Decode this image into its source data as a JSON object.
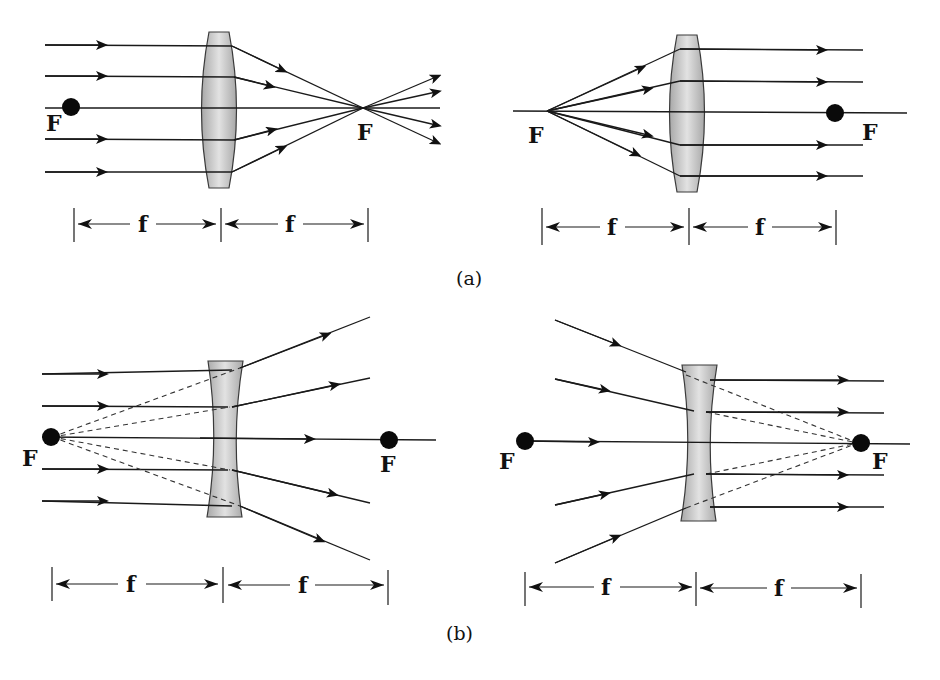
{
  "figure": {
    "captions": {
      "a": "(a)",
      "b": "(b)"
    },
    "focal_label": "F",
    "focal_length_label": "f",
    "colors": {
      "lens_fill_center": "#e2e2e2",
      "lens_fill_edge": "#a8a8a8",
      "ray": "#1a1a1a",
      "dot": "#0a0a0a",
      "background": "#ffffff"
    }
  },
  "panels": [
    {
      "id": "a-left",
      "lens_type": "convex",
      "description": "Parallel rays converge at focal point F after a convex lens",
      "labels": {
        "f_left": "F",
        "f_right": "F",
        "dim_left": "f",
        "dim_right": "f"
      }
    },
    {
      "id": "a-right",
      "lens_type": "convex",
      "description": "Rays from focal point F emerge parallel after a convex lens",
      "labels": {
        "f_left": "F",
        "f_right": "F",
        "dim_left": "f",
        "dim_right": "f"
      }
    },
    {
      "id": "b-left",
      "lens_type": "concave",
      "description": "Parallel rays diverge after a concave lens, appearing to come from F",
      "labels": {
        "f_left": "F",
        "f_right": "F",
        "dim_left": "f",
        "dim_right": "f"
      }
    },
    {
      "id": "b-right",
      "lens_type": "concave",
      "description": "Rays directed toward F emerge parallel after a concave lens",
      "labels": {
        "f_left": "F",
        "f_right": "F",
        "dim_left": "f",
        "dim_right": "f"
      }
    }
  ]
}
